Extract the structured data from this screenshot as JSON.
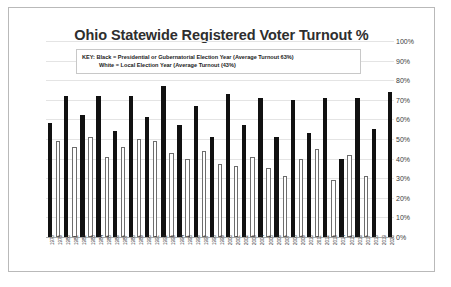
{
  "chart_data": {
    "type": "bar",
    "title": "Ohio Statewide Registered Voter Turnout %",
    "xlabel": "",
    "ylabel": "",
    "ylim": [
      0,
      100
    ],
    "ytick_labels": [
      "100%",
      "90%",
      "80%",
      "70%",
      "60%",
      "50%",
      "40%",
      "30%",
      "20%",
      "10%",
      "0%"
    ],
    "ytick_values": [
      100,
      90,
      80,
      70,
      60,
      50,
      40,
      30,
      20,
      10,
      0
    ],
    "grid": true,
    "legend_position": "top-inside",
    "legend": [
      "KEY: Black = Presidential or Gubernatorial Election Year (Average Turnout 63%)",
      "White = Local Election Year (Average Turnout (43%)"
    ],
    "series_colors": {
      "black": "#111111",
      "white": "#ffffff"
    },
    "categories": [
      "1978",
      "1979",
      "1980",
      "1981",
      "1982",
      "1983",
      "1984",
      "1985",
      "1986",
      "1987",
      "1988",
      "1989",
      "1990",
      "1991",
      "1992",
      "1993",
      "1994",
      "1995",
      "1996",
      "1997",
      "1998",
      "1999",
      "2000",
      "2001",
      "2002",
      "2003",
      "2004",
      "2005",
      "2006",
      "2007",
      "2008",
      "2009",
      "2010",
      "2011",
      "2012",
      "2013",
      "2014",
      "2015",
      "2016",
      "2017",
      "2018",
      "2019",
      "2020"
    ],
    "values": [
      58,
      49,
      72,
      46,
      62,
      51,
      72,
      41,
      54,
      46,
      72,
      50,
      61,
      49,
      77,
      43,
      57,
      40,
      67,
      44,
      51,
      37,
      73,
      36,
      57,
      41,
      71,
      35,
      51,
      31,
      70,
      40,
      53,
      45,
      71,
      29,
      40,
      42,
      71,
      31,
      55,
      null,
      74
    ],
    "bar_types": [
      "black",
      "white",
      "black",
      "white",
      "black",
      "white",
      "black",
      "white",
      "black",
      "white",
      "black",
      "white",
      "black",
      "white",
      "black",
      "white",
      "black",
      "white",
      "black",
      "white",
      "black",
      "white",
      "black",
      "white",
      "black",
      "white",
      "black",
      "white",
      "black",
      "white",
      "black",
      "white",
      "black",
      "white",
      "black",
      "white",
      "black",
      "white",
      "black",
      "white",
      "black",
      "none",
      "black"
    ]
  }
}
